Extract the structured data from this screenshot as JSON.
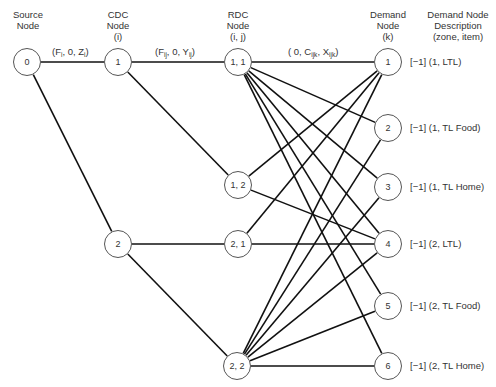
{
  "headers": {
    "source": [
      "Source",
      "Node"
    ],
    "cdc": [
      "CDC",
      "Node",
      "(i)"
    ],
    "rdc": [
      "RDC",
      "Node",
      "(i, j)"
    ],
    "demand": [
      "Demand",
      "Node",
      "(k)"
    ],
    "description": [
      "Demand Node",
      "Description",
      "(zone, item)"
    ]
  },
  "edge_labels": {
    "source_cdc": {
      "pre": "(F",
      "sub1": "i",
      "mid": ", 0, Z",
      "sub2": "i",
      "post": ")"
    },
    "cdc_rdc": {
      "pre": "(F",
      "sub1": "ij",
      "mid": ", 0, Y",
      "sub2": "ij",
      "post": ")"
    },
    "rdc_demand": {
      "pre": "( 0, C",
      "sub1": "ijk",
      "mid": ", X",
      "sub2": "ijk",
      "post": ")"
    }
  },
  "nodes": {
    "source": [
      {
        "id": "0",
        "label": "0",
        "x": 27,
        "y": 62
      }
    ],
    "cdc": [
      {
        "id": "1",
        "label": "1",
        "x": 118,
        "y": 62
      },
      {
        "id": "2",
        "label": "2",
        "x": 118,
        "y": 244
      }
    ],
    "rdc": [
      {
        "id": "1,1",
        "label": "1, 1",
        "x": 238,
        "y": 62
      },
      {
        "id": "1,2",
        "label": "1, 2",
        "x": 238,
        "y": 185
      },
      {
        "id": "2,1",
        "label": "2, 1",
        "x": 238,
        "y": 244
      },
      {
        "id": "2,2",
        "label": "2, 2",
        "x": 237,
        "y": 366
      }
    ],
    "demand": [
      {
        "id": "1",
        "label": "1",
        "x": 388,
        "y": 62,
        "desc": "[−1] (1, LTL)"
      },
      {
        "id": "2",
        "label": "2",
        "x": 388,
        "y": 128,
        "desc": "[−1] (1, TL Food)"
      },
      {
        "id": "3",
        "label": "3",
        "x": 388,
        "y": 187,
        "desc": "[−1] (1, TL Home)"
      },
      {
        "id": "4",
        "label": "4",
        "x": 388,
        "y": 244,
        "desc": "[−1] (2, LTL)"
      },
      {
        "id": "5",
        "label": "5",
        "x": 388,
        "y": 306,
        "desc": "[−1] (2, TL Food)"
      },
      {
        "id": "6",
        "label": "6",
        "x": 388,
        "y": 366,
        "desc": "[−1] (2, TL Home)"
      }
    ]
  },
  "edges": [
    [
      "source:0",
      "cdc:1"
    ],
    [
      "source:0",
      "cdc:2"
    ],
    [
      "cdc:1",
      "rdc:1,1"
    ],
    [
      "cdc:1",
      "rdc:1,2"
    ],
    [
      "cdc:2",
      "rdc:2,1"
    ],
    [
      "cdc:2",
      "rdc:2,2"
    ],
    [
      "rdc:1,1",
      "demand:1"
    ],
    [
      "rdc:1,1",
      "demand:2"
    ],
    [
      "rdc:1,1",
      "demand:3"
    ],
    [
      "rdc:1,1",
      "demand:4"
    ],
    [
      "rdc:1,1",
      "demand:5"
    ],
    [
      "rdc:1,1",
      "demand:6"
    ],
    [
      "rdc:1,2",
      "demand:1"
    ],
    [
      "rdc:1,2",
      "demand:4"
    ],
    [
      "rdc:2,1",
      "demand:1"
    ],
    [
      "rdc:2,1",
      "demand:4"
    ],
    [
      "rdc:2,2",
      "demand:1"
    ],
    [
      "rdc:2,2",
      "demand:2"
    ],
    [
      "rdc:2,2",
      "demand:3"
    ],
    [
      "rdc:2,2",
      "demand:4"
    ],
    [
      "rdc:2,2",
      "demand:5"
    ],
    [
      "rdc:2,2",
      "demand:6"
    ]
  ],
  "style": {
    "line_color": "#111111",
    "node_border": "#555555",
    "text_color": "#333333"
  }
}
